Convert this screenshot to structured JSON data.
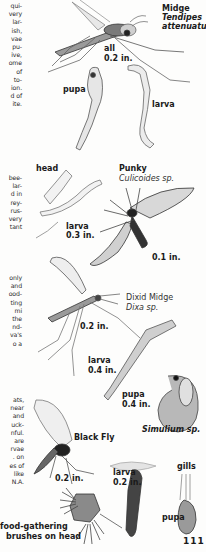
{
  "page": {
    "number": "111",
    "text_blocks": [
      {
        "id": "midge-text",
        "lines": [
          "qui-",
          "very",
          "lar-",
          "ish,",
          "vae",
          "pu-",
          "ive,",
          "ome",
          "of",
          "to-",
          "ion.",
          "d of",
          "ite."
        ]
      },
      {
        "id": "punky-text",
        "lines": [
          "bee-",
          "lar-",
          "d in",
          "rey-",
          "rus-",
          "very",
          "tant"
        ]
      },
      {
        "id": "dixid-text",
        "lines": [
          "only",
          "and",
          "ood-",
          "ting",
          "mi",
          "the",
          "nd-",
          "va's",
          "o a"
        ]
      },
      {
        "id": "blackfly-text",
        "lines": [
          "ats,",
          "near",
          "and",
          "uck-",
          "nful.",
          "are",
          "rvae",
          ". on",
          "es of",
          "like",
          "N.A."
        ]
      }
    ]
  },
  "figures": {
    "midge": {
      "common_name": "Midge",
      "scientific_name": "Tendipes",
      "scientific_name_2": "attenuatus",
      "size_label": "all",
      "size": "0.2 in.",
      "pupa_label": "pupa",
      "larva_label": "larva"
    },
    "punky": {
      "head_label": "head",
      "common_name": "Punky",
      "scientific_name": "Culicoides sp.",
      "larva_label": "larva",
      "larva_size": "0.3 in.",
      "adult_size": "0.1 in."
    },
    "dixid": {
      "common_name": "Dixid Midge",
      "scientific_name": "Dixa sp.",
      "adult_size": "0.2 in.",
      "larva_label": "larva",
      "larva_size": "0.4 in.",
      "pupa_label": "pupa",
      "pupa_size": "0.4 in."
    },
    "blackfly": {
      "scientific_name": "Simulium sp.",
      "common_name": "Black Fly",
      "adult_size": "0.2 in.",
      "larva_label": "larva",
      "larva_size": "0.2 in.",
      "gills_label": "gills",
      "pupa_label": "pupa",
      "brushes_label_1": "food-gathering",
      "brushes_label_2": "brushes on head"
    }
  }
}
